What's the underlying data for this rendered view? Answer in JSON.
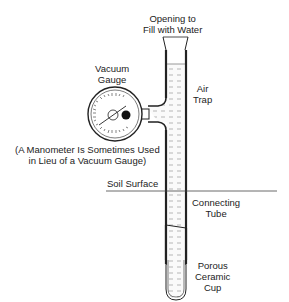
{
  "labels": {
    "opening": [
      "Opening to",
      "Fill with Water"
    ],
    "vacuum_gauge": [
      "Vacuum",
      "Gauge"
    ],
    "air_trap": [
      "Air",
      "Trap"
    ],
    "manometer_note": [
      "(A Manometer Is Sometimes Used",
      "in Lieu of a Vacuum Gauge)"
    ],
    "soil_surface": "Soil Surface",
    "connecting_tube": [
      "Connecting",
      "Tube"
    ],
    "porous_cup": [
      "Porous",
      "Ceramic",
      "Cup"
    ]
  },
  "colors": {
    "line": "#222222",
    "water": "#e8e8e8"
  }
}
